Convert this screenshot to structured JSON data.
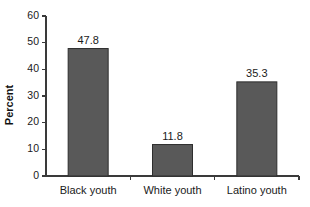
{
  "chart_data": {
    "type": "bar",
    "title": "",
    "subtitle": "",
    "xlabel": "",
    "ylabel": "Percent",
    "categories": [
      "Black youth",
      "White youth",
      "Latino youth"
    ],
    "values": [
      47.8,
      11.8,
      35.3
    ],
    "value_labels": [
      "47.8",
      "11.8",
      "35.3"
    ],
    "ylim": [
      0,
      60
    ],
    "ytick_values": [
      0,
      10,
      20,
      30,
      40,
      50,
      60
    ],
    "ytick_labels": [
      "0",
      "10",
      "20",
      "30",
      "40",
      "50",
      "60"
    ],
    "grid": false,
    "legend": false,
    "legend_position": "none",
    "bar_color": "#595959",
    "bar_edge_color": "#2e2e2e",
    "axis_color": "#3a3a3a",
    "text_color": "#1a1a1a",
    "background_color": "#ffffff"
  }
}
